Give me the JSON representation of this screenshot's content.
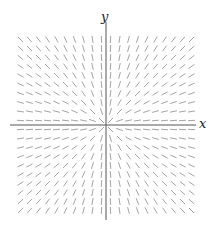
{
  "diagram": {
    "equation": "dy/dx = y/x",
    "axes": {
      "x_label": "x",
      "y_label": "y",
      "origin_px": [
        106,
        125
      ],
      "x_extent_px": [
        10,
        196
      ],
      "y_extent_px": [
        22,
        220
      ],
      "color": "#555555"
    },
    "grid": {
      "columns": 20,
      "rows": 20,
      "range": [
        -10,
        10
      ],
      "spacing_px": 9,
      "segment_length_px": 7,
      "segment_color": "#9a9a9a"
    }
  }
}
